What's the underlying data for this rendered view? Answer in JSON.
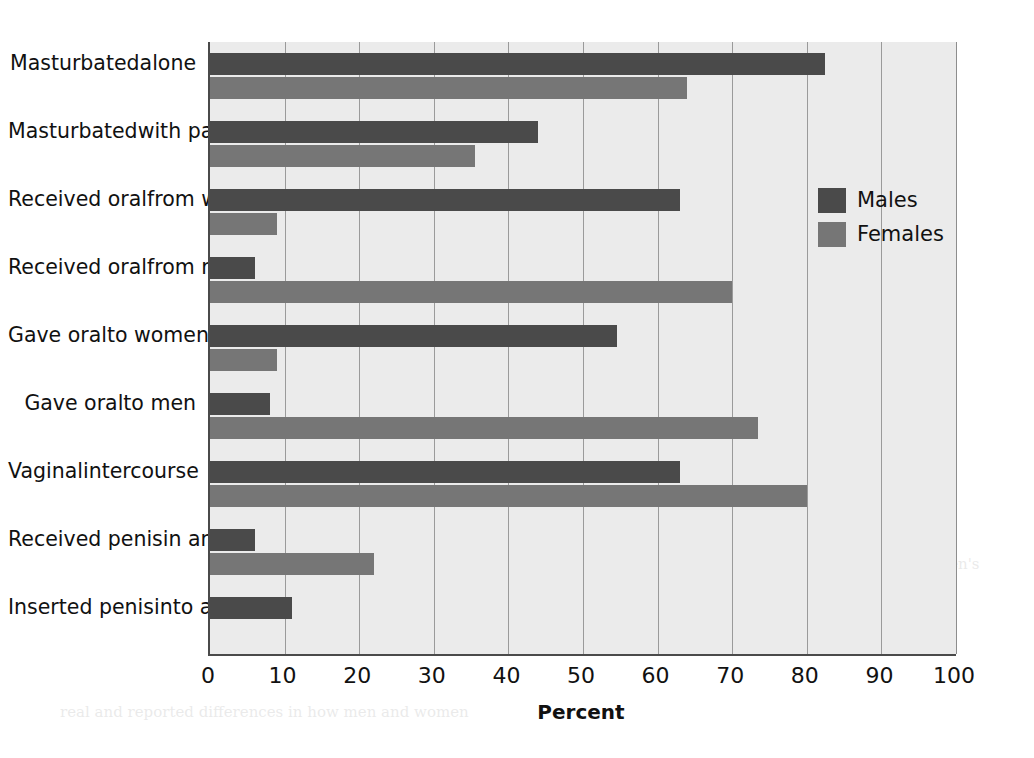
{
  "chart_data": {
    "type": "bar",
    "orientation": "horizontal",
    "title": "",
    "xlabel": "Percent",
    "ylabel": "",
    "xlim": [
      0,
      100
    ],
    "xticks": [
      0,
      10,
      20,
      30,
      40,
      50,
      60,
      70,
      80,
      90,
      100
    ],
    "xtick_labels": [
      "0",
      "10",
      "20",
      "30",
      "40",
      "50",
      "60",
      "70",
      "80",
      "90",
      "100"
    ],
    "grid": "vertical",
    "legend_position": "upper-right-inside",
    "categories": [
      "Masturbated alone",
      "Masturbated with partner",
      "Received oral from women",
      "Received oral from men",
      "Gave oral to women",
      "Gave oral to men",
      "Vaginal intercourse",
      "Received penis in anus",
      "Inserted penis into anus"
    ],
    "category_lines": [
      [
        "Masturbated",
        "alone"
      ],
      [
        "Masturbated",
        "with partner"
      ],
      [
        "Received oral",
        "from women"
      ],
      [
        "Received oral",
        "from men"
      ],
      [
        "Gave oral",
        "to women"
      ],
      [
        "Gave oral",
        "to men"
      ],
      [
        "Vaginal",
        "intercourse"
      ],
      [
        "Received penis",
        "in anus"
      ],
      [
        "Inserted penis",
        "into anus"
      ]
    ],
    "series": [
      {
        "name": "Males",
        "color": "#4a4a4a",
        "values": [
          82.5,
          44.0,
          63.0,
          6.0,
          54.5,
          8.0,
          63.0,
          6.0,
          11.0
        ]
      },
      {
        "name": "Females",
        "color": "#767676",
        "values": [
          64.0,
          35.5,
          9.0,
          70.0,
          9.0,
          73.5,
          80.0,
          22.0,
          0.0
        ]
      }
    ]
  },
  "legend": {
    "items": [
      {
        "label": "Males",
        "color": "#4a4a4a"
      },
      {
        "label": "Females",
        "color": "#767676"
      }
    ]
  },
  "axis": {
    "x_title": "Percent"
  },
  "page_background_text": {
    "lines": [
      "have been found in",
      "the distribution of ages in",
      "considerable variation in",
      "reported sexual behavior in",
      "other studies have reported",
      "other views about the level and meaning of the differences",
      "between the reports of men and women.",
      "A similar pattern was observed in",
      "the range of sexual practices that respondents reported",
      "over the prior year, with notable variation by age and",
      "orientation (Figure 1).",
      "Differences",
      "Most of the variation in the distribution of men's and women's",
      "reports of frequency of sexual practice. This is reflected",
      "in part in the patterns of behavior, which may reflect both",
      "real and reported differences in how men and women"
    ]
  }
}
